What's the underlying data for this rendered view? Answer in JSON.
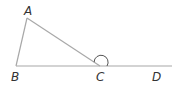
{
  "diagram": {
    "type": "geometry-triangle-exterior-angle",
    "points": {
      "A": {
        "label": "A",
        "x": 27,
        "y": 18,
        "lx": 24,
        "ly": 15
      },
      "B": {
        "label": "B",
        "x": 16,
        "y": 66,
        "lx": 11,
        "ly": 81
      },
      "C": {
        "label": "C",
        "x": 100,
        "y": 66,
        "lx": 96,
        "ly": 81
      },
      "D": {
        "label": "D",
        "x": 172,
        "y": 66,
        "lx": 152,
        "ly": 81
      }
    },
    "line_color": "#a8a8a8",
    "arc_color": "#555555"
  }
}
